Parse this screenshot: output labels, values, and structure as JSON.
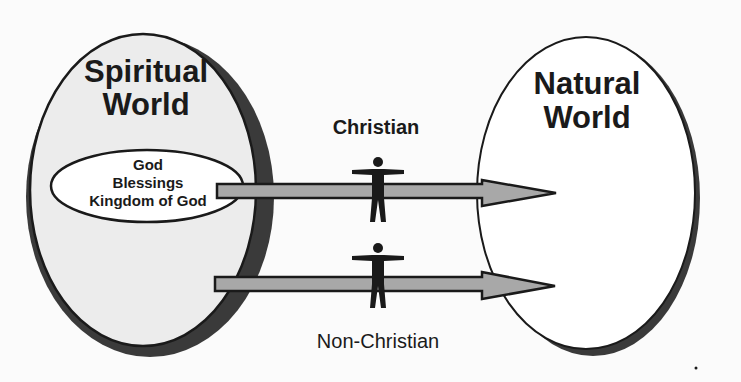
{
  "diagram": {
    "type": "concept-diagram",
    "colors": {
      "background": "#fbfbfb",
      "spiritual_fill": "#ececec",
      "natural_fill": "#ffffff",
      "outline": "#1a1a1a",
      "shadow": "#3a3a3a",
      "arrow_fill": "#a8a8a8",
      "figure": "#1a1a1a"
    },
    "spiritual_world": {
      "title_line1": "Spiritual",
      "title_line2": "World",
      "inner_ellipse": {
        "line1": "God",
        "line2": "Blessings",
        "line3": "Kingdom of God"
      }
    },
    "natural_world": {
      "title_line1": "Natural",
      "title_line2": "World"
    },
    "paths": [
      {
        "label": "Christian",
        "from": "Kingdom of God (Spiritual World)",
        "to": "Natural World",
        "label_position": "above"
      },
      {
        "label": "Non-Christian",
        "from": "Spiritual World",
        "to": "Natural World",
        "label_position": "below"
      }
    ],
    "figures": [
      {
        "name": "person",
        "on_path": "Christian"
      },
      {
        "name": "person",
        "on_path": "Non-Christian"
      }
    ]
  }
}
